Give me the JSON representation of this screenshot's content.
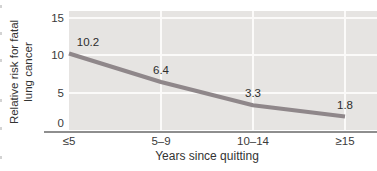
{
  "figure": {
    "y_axis_title": {
      "line1": "Relative risk for fatal",
      "line2": "lung cancer"
    },
    "x_axis_title": "Years since quitting"
  },
  "chart_data": {
    "type": "line",
    "title": "",
    "categories": [
      "≤5",
      "5–9",
      "10–14",
      "≥15"
    ],
    "values": [
      10.2,
      6.4,
      3.3,
      1.8
    ],
    "data_labels": [
      "10.2",
      "6.4",
      "3.3",
      "1.8"
    ],
    "xlabel": "Years since quitting",
    "ylabel": "Relative risk for fatal lung cancer",
    "ylim": [
      0,
      15
    ],
    "y_ticks": [
      0,
      5,
      10,
      15
    ],
    "grid": true,
    "legend_position": "none",
    "plot_bg": "#e6e4e2",
    "gridline_color": "#fbfaf9",
    "line_color": "#8f878a",
    "axis_line_color": "#8e8e8e",
    "text_color": "#3a3a3a"
  }
}
